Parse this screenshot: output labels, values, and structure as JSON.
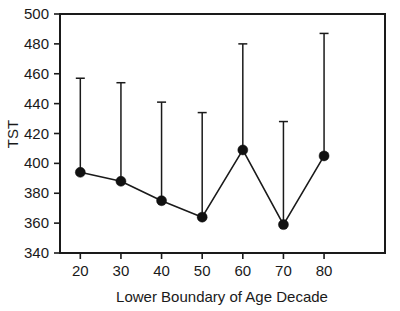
{
  "chart_data": {
    "type": "line",
    "title": "",
    "subtitle": "",
    "xlabel": "Lower Boundary of Age Decade",
    "ylabel": "TST",
    "categories": [
      20,
      30,
      40,
      50,
      60,
      70,
      80
    ],
    "x": [
      20,
      30,
      40,
      50,
      60,
      70,
      80
    ],
    "values": [
      394,
      388,
      375,
      364,
      409,
      359,
      405
    ],
    "error_upper": [
      457,
      454,
      441,
      434,
      480,
      428,
      487
    ],
    "error_bars": "upper-only-with-caps",
    "series": [
      {
        "name": "TST",
        "values": [
          394,
          388,
          375,
          364,
          409,
          359,
          405
        ]
      }
    ],
    "xlim": [
      15,
      95
    ],
    "ylim": [
      340,
      500
    ],
    "yticks": [
      340,
      360,
      380,
      400,
      420,
      440,
      460,
      480,
      500
    ],
    "ytick_labels": [
      "340",
      "360",
      "380",
      "400",
      "420",
      "440",
      "460",
      "480",
      "500"
    ],
    "xticks": [
      20,
      30,
      40,
      50,
      60,
      70,
      80
    ],
    "xtick_labels": [
      "20",
      "30",
      "40",
      "50",
      "60",
      "70",
      "80"
    ],
    "grid": false,
    "legend": false,
    "legend_position": "none",
    "marker": "filled-circle",
    "colors": {
      "line": "#1a1a1a",
      "marker": "#111111",
      "axis": "#1a1a1a",
      "background": "#ffffff"
    },
    "annotations": []
  }
}
